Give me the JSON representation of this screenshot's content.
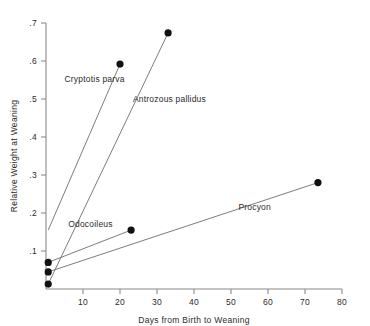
{
  "chart_data": {
    "type": "line",
    "title": "",
    "xlabel": "Days from Birth to Weaning",
    "ylabel": "Relative Weight at Weaning",
    "xlim": [
      0,
      80
    ],
    "ylim": [
      0,
      0.7
    ],
    "xticks": [
      10,
      20,
      30,
      40,
      50,
      60,
      70,
      80
    ],
    "xtick_labels": [
      "10",
      "20",
      "30",
      "40",
      "50",
      "60",
      "70",
      "80"
    ],
    "yticks": [
      0.1,
      0.2,
      0.3,
      0.4,
      0.5,
      0.6,
      0.7
    ],
    "ytick_labels": [
      ".1",
      ".2",
      ".3",
      ".4",
      ".5",
      ".6",
      ".7"
    ],
    "grid": false,
    "legend": "inline-annotations",
    "series": [
      {
        "name": "Cryptotis parva",
        "label_x": 5.0,
        "label_y": 0.545,
        "x": [
          0.6,
          20.0
        ],
        "y": [
          0.155,
          0.592
        ],
        "markers": [
          false,
          true
        ]
      },
      {
        "name": "Antrozous pallidus",
        "label_x": 23.5,
        "label_y": 0.492,
        "x": [
          0.6,
          33.0
        ],
        "y": [
          0.013,
          0.674
        ],
        "markers": [
          true,
          true
        ]
      },
      {
        "name": "Odocoileus",
        "label_x": 6.0,
        "label_y": 0.163,
        "x": [
          0.6,
          23.0
        ],
        "y": [
          0.07,
          0.155
        ],
        "markers": [
          true,
          true
        ]
      },
      {
        "name": "Procyon",
        "label_x": 52.0,
        "label_y": 0.208,
        "x": [
          0.6,
          73.5
        ],
        "y": [
          0.045,
          0.28
        ],
        "markers": [
          true,
          true
        ]
      }
    ],
    "colors": {
      "line": "#6d6d6d",
      "marker": "#111111",
      "axis": "#8a8a8a",
      "text": "#2b2b2b",
      "background": "#ffffff"
    }
  }
}
